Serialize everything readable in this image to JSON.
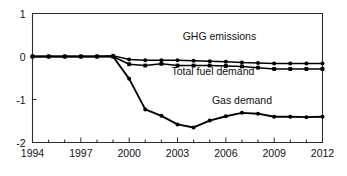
{
  "chart_data": {
    "type": "line",
    "title": "",
    "subtitle": "",
    "xlabel": "",
    "ylabel": "",
    "xlim": [
      1994,
      2012
    ],
    "ylim": [
      -2,
      1
    ],
    "grid": false,
    "legend_position": "inline-annotations",
    "x": [
      1994,
      1995,
      1996,
      1997,
      1998,
      1999,
      2000,
      2001,
      2002,
      2003,
      2004,
      2005,
      2006,
      2007,
      2008,
      2009,
      2010,
      2011,
      2012
    ],
    "xticks": [
      "1994",
      "1997",
      "2000",
      "2003",
      "2006",
      "2009",
      "2012"
    ],
    "xtick_values": [
      1994,
      1997,
      2000,
      2003,
      2006,
      2009,
      2012
    ],
    "yticks": [
      "1",
      "0",
      "-1",
      "-2"
    ],
    "ytick_values": [
      1,
      0,
      -1,
      -2
    ],
    "series": [
      {
        "name": "GHG emissions",
        "marker": "circle",
        "label_x": 2005.6,
        "label_y": 0.38,
        "values": [
          0.0,
          0.0,
          0.0,
          0.0,
          0.0,
          0.02,
          -0.07,
          -0.09,
          -0.09,
          -0.09,
          -0.1,
          -0.11,
          -0.12,
          -0.14,
          -0.15,
          -0.16,
          -0.16,
          -0.16,
          -0.16
        ]
      },
      {
        "name": "Total fuel demand",
        "marker": "square",
        "label_x": 2005.2,
        "label_y": -0.42,
        "values": [
          0.0,
          0.0,
          0.0,
          0.0,
          0.0,
          0.0,
          -0.18,
          -0.21,
          -0.17,
          -0.21,
          -0.21,
          -0.21,
          -0.22,
          -0.23,
          -0.26,
          -0.29,
          -0.29,
          -0.29,
          -0.29
        ]
      },
      {
        "name": "Gas demand",
        "marker": "circle",
        "label_x": 2007.0,
        "label_y": -1.1,
        "values": [
          0.0,
          0.0,
          0.0,
          0.0,
          0.0,
          0.0,
          -0.52,
          -1.23,
          -1.38,
          -1.58,
          -1.65,
          -1.49,
          -1.39,
          -1.31,
          -1.33,
          -1.4,
          -1.4,
          -1.41,
          -1.4
        ]
      }
    ]
  },
  "axes": {
    "y_top_label": "1",
    "y_zero_label": "0",
    "y_minus_one_label": "-1",
    "y_minus_two_label": "-2"
  }
}
